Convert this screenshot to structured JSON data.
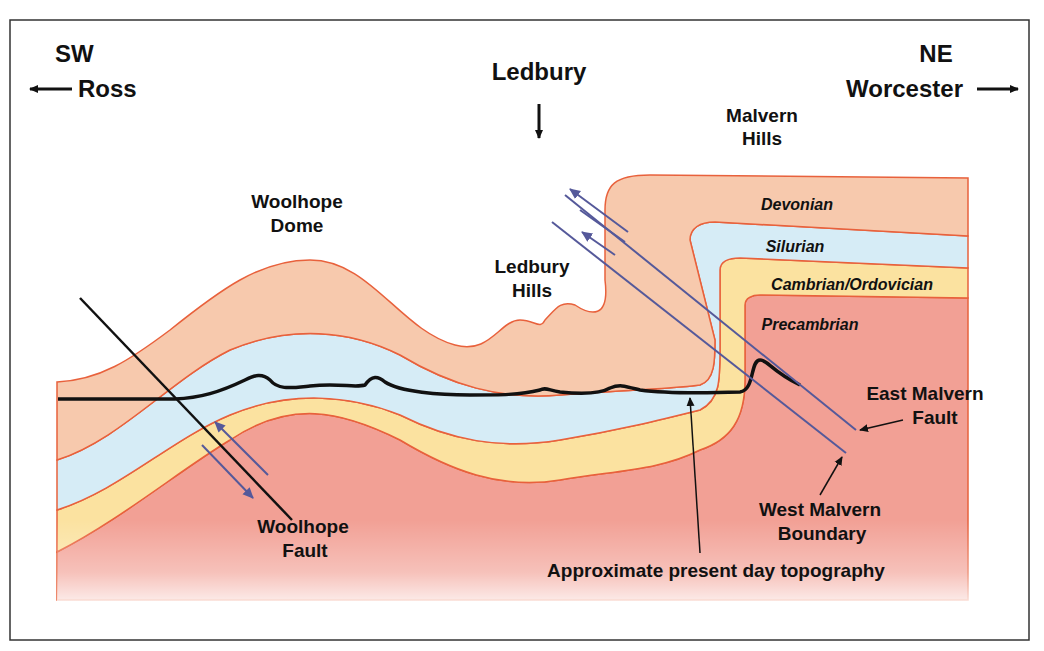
{
  "diagram": {
    "type": "geological cross-section",
    "directions": {
      "left": {
        "compass": "SW",
        "place": "Ross"
      },
      "right": {
        "compass": "NE",
        "place": "Worcester"
      },
      "center": {
        "place": "Ledbury"
      }
    },
    "features": {
      "woolhope_dome": [
        "Woolhope",
        "Dome"
      ],
      "ledbury_hills": [
        "Ledbury",
        "Hills"
      ],
      "malvern_hills": [
        "Malvern",
        "Hills"
      ]
    },
    "strata": [
      {
        "name": "Devonian",
        "color": "#f7c9ad"
      },
      {
        "name": "Silurian",
        "color": "#d6ecf6"
      },
      {
        "name": "Cambrian/Ordovician",
        "color": "#fbe2a0"
      },
      {
        "name": "Precambrian",
        "color": "#f2a095"
      }
    ],
    "annotations": {
      "woolhope_fault": [
        "Woolhope",
        "Fault"
      ],
      "east_malvern_fault": [
        "East Malvern",
        "Fault"
      ],
      "west_malvern_boundary": [
        "West Malvern",
        "Boundary"
      ],
      "topography": "Approximate present day topography"
    },
    "colors": {
      "boundary_line": "#e8613c",
      "fault_blue": "#55599a",
      "text": "#111111"
    }
  }
}
